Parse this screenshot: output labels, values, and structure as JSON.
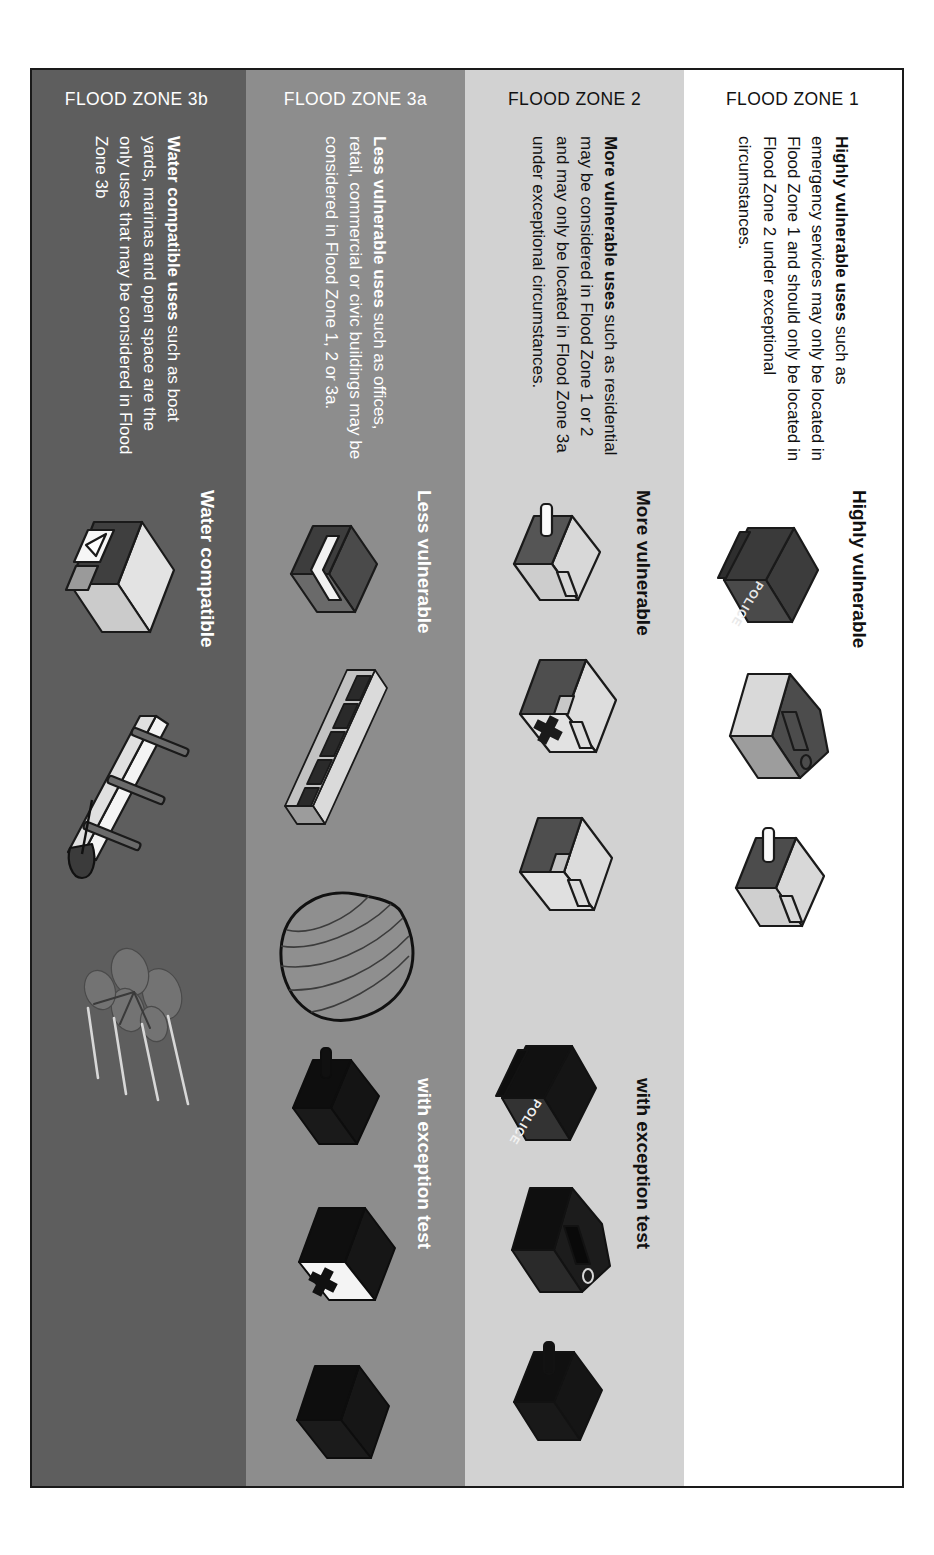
{
  "figure": {
    "exception_test_label": "with exception test",
    "caption": ""
  },
  "colors": {
    "zone1_band": "#ffffff",
    "zone2_band": "#d2d2d2",
    "zone3a_band": "#8d8d8d",
    "zone3b_band": "#5e5e5e",
    "border": "#1a1a1a",
    "text_dark": "#111111",
    "text_light": "#ffffff"
  },
  "bands": [
    {
      "zone_label": "FLOOD ZONE 1",
      "category": "Highly vulnerable",
      "desc_lead": "Highly vulnerable uses",
      "desc_rest": " such as emergency services may only be located in Flood Zone 1 and should only be located in Flood Zone 2 under exceptional circumstances.",
      "has_exception_column": false,
      "exception_label": "",
      "icons": [
        {
          "name": "police-station-building-icon",
          "label": "POLICE",
          "style": "dark"
        },
        {
          "name": "care-home-building-icon",
          "label": "",
          "style": "pale"
        },
        {
          "name": "fire-station-building-icon",
          "label": "",
          "style": "mixed"
        }
      ]
    },
    {
      "zone_label": "FLOOD ZONE 2",
      "category": "More vulnerable",
      "desc_lead": "More vulnerable uses",
      "desc_rest": " such as residential may be considered in Flood Zone 1 or 2 and may only be located in Flood Zone 3a under exceptional circumstances.",
      "has_exception_column": true,
      "exception_label": "with exception test",
      "icons": [
        {
          "name": "house-building-icon",
          "label": "",
          "style": "mixed"
        },
        {
          "name": "hospital-building-icon",
          "label": "",
          "style": "cross"
        },
        {
          "name": "school-building-icon",
          "label": "",
          "style": "mixed"
        }
      ],
      "exception_icons": [
        {
          "name": "police-station-silhouette-icon",
          "label": "POLICE",
          "style": "silhouette-police"
        },
        {
          "name": "care-home-silhouette-icon",
          "label": "",
          "style": "silhouette"
        },
        {
          "name": "emergency-building-silhouette-icon",
          "label": "",
          "style": "silhouette"
        }
      ]
    },
    {
      "zone_label": "FLOOD ZONE 3a",
      "category": "Less vulnerable",
      "desc_lead": "Less vulnerable uses",
      "desc_rest": " such as offices, retail, commercial or civic buildings may be considered in Flood Zone 1, 2 or 3a.",
      "has_exception_column": true,
      "exception_label": "with exception test",
      "icons": [
        {
          "name": "office-building-icon",
          "label": "",
          "style": "office"
        },
        {
          "name": "terrace-housing-icon",
          "label": "",
          "style": "terrace"
        },
        {
          "name": "stadium-dome-icon",
          "label": "",
          "style": "dome"
        }
      ],
      "exception_icons": [
        {
          "name": "house-silhouette-icon",
          "label": "",
          "style": "silhouette"
        },
        {
          "name": "hospital-silhouette-icon",
          "label": "",
          "style": "silhouette-cross"
        },
        {
          "name": "school-silhouette-icon",
          "label": "",
          "style": "silhouette"
        }
      ]
    },
    {
      "zone_label": "FLOOD ZONE 3b",
      "category": "Water compatible",
      "desc_lead": "Water compatible uses",
      "desc_rest": " such as boat yards, marinas and open space are the only uses that may be considered in Flood Zone 3b",
      "has_exception_column": false,
      "exception_label": "",
      "icons": [
        {
          "name": "boatyard-building-icon",
          "label": "",
          "style": "boatyard"
        },
        {
          "name": "jetty-with-boat-icon",
          "label": "",
          "style": "jetty"
        },
        {
          "name": "tree-open-space-icon",
          "label": "",
          "style": "tree"
        }
      ]
    }
  ]
}
